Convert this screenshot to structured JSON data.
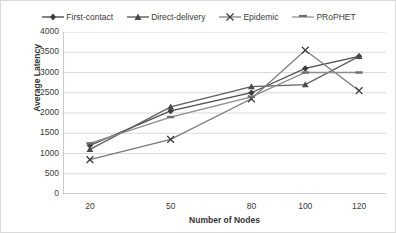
{
  "chart_data": {
    "type": "line",
    "title": "",
    "xlabel": "Number of Nodes",
    "ylabel": "Average Latency",
    "x": [
      20,
      50,
      80,
      100,
      120
    ],
    "categories": [
      "20",
      "50",
      "80",
      "100",
      "120"
    ],
    "xtick_labels": [
      "20",
      "50",
      "80",
      "100",
      "120"
    ],
    "ytick_labels": [
      "0",
      "500",
      "1000",
      "1500",
      "2000",
      "2500",
      "3000",
      "3500",
      "4000"
    ],
    "ytick_values": [
      0,
      500,
      1000,
      1500,
      2000,
      2500,
      3000,
      3500,
      4000
    ],
    "ylim": [
      0,
      4000
    ],
    "grid": true,
    "legend_position": "top",
    "series": [
      {
        "name": "First-contact",
        "marker": "diamond",
        "color": "#4d4d4d",
        "values": [
          1200,
          2050,
          2500,
          3100,
          3400
        ]
      },
      {
        "name": "Direct-delivery",
        "marker": "triangle",
        "color": "#5f5f5f",
        "values": [
          1100,
          2150,
          2650,
          2700,
          3400
        ]
      },
      {
        "name": "Epidemic",
        "marker": "cross",
        "color": "#7a7a7a",
        "values": [
          850,
          1350,
          2350,
          3550,
          2550
        ]
      },
      {
        "name": "PRoPHET",
        "marker": "dash",
        "color": "#8c8c8c",
        "values": [
          1250,
          1900,
          2400,
          3000,
          3000
        ]
      }
    ]
  },
  "legend": {
    "items": [
      {
        "label": "First-contact"
      },
      {
        "label": "Direct-delivery"
      },
      {
        "label": "Epidemic"
      },
      {
        "label": "PRoPHET"
      }
    ]
  },
  "axes": {
    "y_title": "Average Latency",
    "x_title": "Number of Nodes"
  }
}
